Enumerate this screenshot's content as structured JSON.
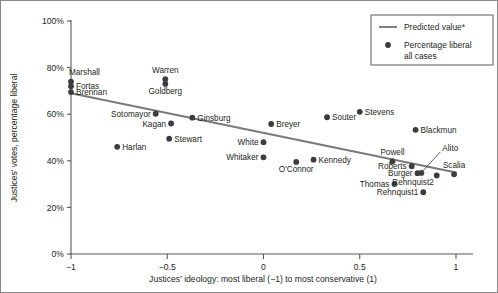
{
  "chart_data": {
    "type": "scatter",
    "title": "",
    "subtitle": "",
    "xlabel": "Justices' ideology: most liberal (−1) to most conservative (1)",
    "ylabel": "Justices' votes, percentage liberal",
    "xlim": [
      -1.1,
      1.08
    ],
    "ylim": [
      0,
      100
    ],
    "xticks": [
      -1,
      -0.5,
      0,
      0.5,
      1
    ],
    "xticklabels": [
      "−1",
      "−0.5",
      "0",
      "0.5",
      "1"
    ],
    "yticks": [
      0,
      20,
      40,
      60,
      80,
      100
    ],
    "yticklabels": [
      "0%",
      "20%",
      "40%",
      "60%",
      "80%",
      "100%"
    ],
    "grid": false,
    "legend_position": "top-right",
    "legend": [
      {
        "marker": "line",
        "label": "Predicted value*"
      },
      {
        "marker": "dot",
        "label": "Percentage liberal all cases"
      }
    ],
    "series": [
      {
        "name": "Percentage liberal all cases",
        "type": "scatter",
        "color": "#3d3d3f",
        "points": [
          {
            "label": "Marshall",
            "x": -1.0,
            "y": 74.0,
            "label_pos": "above-left"
          },
          {
            "label": "Fortas",
            "x": -1.0,
            "y": 72.0,
            "label_pos": "right"
          },
          {
            "label": "Brennan",
            "x": -1.0,
            "y": 69.5,
            "label_pos": "right"
          },
          {
            "label": "Warren",
            "x": -0.51,
            "y": 75.0,
            "label_pos": "above"
          },
          {
            "label": "Goldberg",
            "x": -0.51,
            "y": 73.0,
            "label_pos": "below"
          },
          {
            "label": "Sotomayor",
            "x": -0.56,
            "y": 60.2,
            "label_pos": "left"
          },
          {
            "label": "Kagan",
            "x": -0.48,
            "y": 56.0,
            "label_pos": "left"
          },
          {
            "label": "Ginsburg",
            "x": -0.37,
            "y": 58.5,
            "label_pos": "right"
          },
          {
            "label": "Stewart",
            "x": -0.49,
            "y": 49.5,
            "label_pos": "right"
          },
          {
            "label": "Harlan",
            "x": -0.76,
            "y": 46.0,
            "label_pos": "right"
          },
          {
            "label": "Breyer",
            "x": 0.04,
            "y": 55.8,
            "label_pos": "right"
          },
          {
            "label": "White",
            "x": 0.0,
            "y": 48.0,
            "label_pos": "left"
          },
          {
            "label": "Whitaker",
            "x": 0.0,
            "y": 41.5,
            "label_pos": "left"
          },
          {
            "label": "O'Connor",
            "x": 0.17,
            "y": 39.5,
            "label_pos": "below"
          },
          {
            "label": "Kennedy",
            "x": 0.26,
            "y": 40.5,
            "label_pos": "right"
          },
          {
            "label": "Souter",
            "x": 0.33,
            "y": 58.7,
            "label_pos": "right"
          },
          {
            "label": "Stevens",
            "x": 0.5,
            "y": 61.0,
            "label_pos": "right"
          },
          {
            "label": "Blackmun",
            "x": 0.79,
            "y": 53.3,
            "label_pos": "right"
          },
          {
            "label": "Powell",
            "x": 0.67,
            "y": 39.7,
            "label_pos": "above"
          },
          {
            "label": "Roberts",
            "x": 0.77,
            "y": 37.7,
            "label_pos": "left"
          },
          {
            "label": "Burger",
            "x": 0.8,
            "y": 34.7,
            "label_pos": "left"
          },
          {
            "label": "Thomas",
            "x": 0.68,
            "y": 30.0,
            "label_pos": "left"
          },
          {
            "label": "Rehnquist1",
            "x": 0.83,
            "y": 26.5,
            "label_pos": "left"
          },
          {
            "label": "Rehnquist2",
            "x": 0.9,
            "y": 33.7,
            "label_pos": "below-left"
          },
          {
            "label": "Alito",
            "x": 0.82,
            "y": 34.8,
            "label_pos": "leader-up-right"
          },
          {
            "label": "Scalia",
            "x": 0.99,
            "y": 34.2,
            "label_pos": "above"
          }
        ]
      },
      {
        "name": "Predicted value*",
        "type": "line",
        "color": "#7a7a7c",
        "x": [
          -1.0,
          1.0
        ],
        "y": [
          69.0,
          35.0
        ]
      }
    ],
    "footnote": ""
  }
}
